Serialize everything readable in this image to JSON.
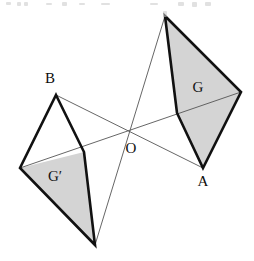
{
  "figure": {
    "background_color": "#ffffff",
    "stroke_color": "#111111",
    "thin_stroke_color": "#555555",
    "shade_color": "#d4d4d4",
    "thick_stroke_width": 2.6,
    "thin_stroke_width": 0.9,
    "labels": {
      "point_a": "A",
      "point_b": "B",
      "point_o": "O",
      "region_g": "G",
      "region_g_prime": "G′"
    },
    "label_positions": {
      "point_a": {
        "x": 203,
        "y": 186
      },
      "point_b": {
        "x": 50,
        "y": 83
      },
      "point_o": {
        "x": 131,
        "y": 153
      },
      "region_g": {
        "x": 198,
        "y": 92
      },
      "region_g_prime": {
        "x": 55,
        "y": 181
      }
    },
    "points": {
      "O": {
        "x": 130,
        "y": 133
      },
      "A": {
        "x": 203,
        "y": 168
      },
      "B": {
        "x": 56,
        "y": 95
      },
      "top_apex": {
        "x": 165,
        "y": 16
      },
      "right_vertex": {
        "x": 241,
        "y": 92
      },
      "left_vertex": {
        "x": 20,
        "y": 168
      },
      "bottom_vertex": {
        "x": 95,
        "y": 245
      },
      "right_split": {
        "x": 177,
        "y": 113
      },
      "left_split": {
        "x": 84,
        "y": 152
      }
    },
    "kite_right": {
      "name": "G",
      "outline": "165,16 241,92 203,168 177,113",
      "shaded_half": "165,16 241,92 203,168 177,113",
      "thick_edges": [
        "165,16 177,113",
        "177,113 203,168",
        "165,16 241,92",
        "241,92 203,168"
      ]
    },
    "kite_left": {
      "name": "G′",
      "outline": "56,95 84,152 95,245 20,168",
      "shaded_half": "20,168 84,152 95,245",
      "thick_edges": [
        "56,95 84,152",
        "84,152 95,245",
        "56,95 20,168",
        "20,168 95,245"
      ]
    },
    "thin_lines": [
      {
        "name": "diagonal-apex-to-bottom",
        "x1": 165,
        "y1": 16,
        "x2": 95,
        "y2": 245
      },
      {
        "name": "diagonal-left-to-right",
        "x1": 20,
        "y1": 168,
        "x2": 241,
        "y2": 92
      },
      {
        "name": "segment-b-to-a",
        "x1": 56,
        "y1": 95,
        "x2": 203,
        "y2": 168
      }
    ],
    "scan_artifacts": [
      {
        "x": 6,
        "y": 2,
        "w": 5,
        "h": 3
      },
      {
        "x": 17,
        "y": 2,
        "w": 4,
        "h": 4
      },
      {
        "x": 24,
        "y": 2,
        "w": 4,
        "h": 4
      },
      {
        "x": 46,
        "y": 3,
        "w": 6,
        "h": 2
      },
      {
        "x": 62,
        "y": 2,
        "w": 5,
        "h": 4
      },
      {
        "x": 79,
        "y": 3,
        "w": 6,
        "h": 2
      },
      {
        "x": 101,
        "y": 3,
        "w": 9,
        "h": 2
      },
      {
        "x": 150,
        "y": 3,
        "w": 8,
        "h": 2
      },
      {
        "x": 178,
        "y": 2,
        "w": 6,
        "h": 4
      },
      {
        "x": 192,
        "y": 2,
        "w": 5,
        "h": 5
      },
      {
        "x": 205,
        "y": 2,
        "w": 6,
        "h": 4
      },
      {
        "x": 163,
        "y": 11,
        "w": 4,
        "h": 6
      }
    ]
  }
}
